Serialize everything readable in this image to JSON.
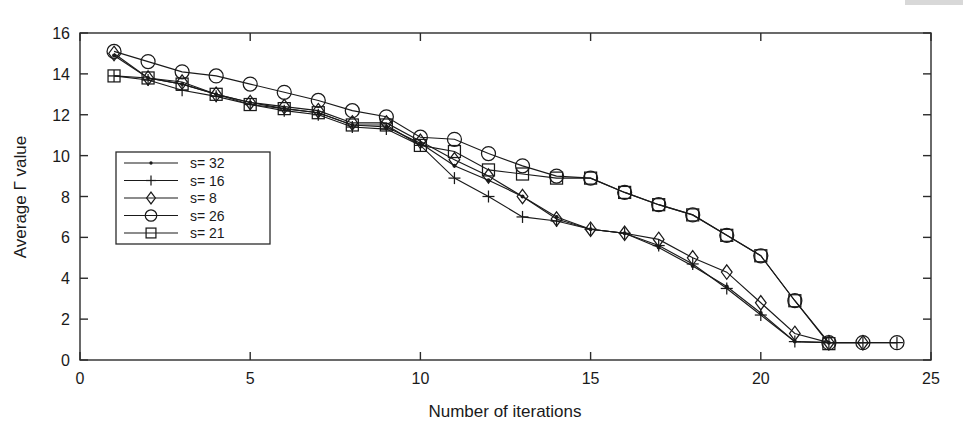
{
  "chart_data": {
    "type": "line",
    "title": "",
    "subtitle": "",
    "xlabel": "Number of iterations",
    "ylabel": "Average Γ value",
    "xlim": [
      0,
      25
    ],
    "ylim": [
      0,
      16
    ],
    "xticks": [
      0,
      5,
      10,
      15,
      20,
      25
    ],
    "yticks": [
      0,
      2,
      4,
      6,
      8,
      10,
      12,
      14,
      16
    ],
    "xtick_labels": [
      "0",
      "5",
      "10",
      "15",
      "20",
      "25"
    ],
    "ytick_labels": [
      "0",
      "2",
      "4",
      "6",
      "8",
      "10",
      "12",
      "14",
      "16"
    ],
    "grid": false,
    "legend_position": "center-left",
    "annotations": [],
    "series": [
      {
        "name": "s= 32",
        "marker": "dot",
        "x": [
          1,
          2,
          3,
          4,
          5,
          6,
          7,
          8,
          9,
          10,
          11,
          12,
          13,
          14,
          15,
          16,
          17,
          18,
          19,
          20,
          21,
          22
        ],
        "values": [
          14.9,
          13.8,
          13.5,
          13.0,
          12.6,
          12.3,
          12.1,
          11.5,
          11.4,
          10.6,
          9.5,
          8.8,
          8.0,
          7.0,
          6.4,
          6.2,
          5.5,
          4.6,
          3.6,
          2.3,
          0.9,
          0.85
        ]
      },
      {
        "name": "s= 16",
        "marker": "plus",
        "x": [
          1,
          2,
          3,
          4,
          5,
          6,
          7,
          8,
          9,
          10,
          11,
          12,
          13,
          14,
          15,
          16,
          17,
          18,
          19,
          20,
          21,
          22,
          23,
          24
        ],
        "values": [
          13.9,
          13.7,
          13.2,
          12.9,
          12.5,
          12.2,
          12.0,
          11.4,
          11.3,
          10.5,
          8.9,
          8.0,
          7.0,
          6.8,
          6.4,
          6.2,
          5.6,
          4.7,
          3.5,
          2.2,
          0.9,
          0.85,
          0.85,
          0.85
        ]
      },
      {
        "name": "s= 8",
        "marker": "diamond",
        "x": [
          1,
          2,
          3,
          4,
          5,
          6,
          7,
          8,
          9,
          10,
          11,
          12,
          13,
          14,
          15,
          16,
          17,
          18,
          19,
          20,
          21,
          22,
          23
        ],
        "values": [
          15.0,
          13.8,
          13.6,
          13.0,
          12.6,
          12.4,
          12.2,
          11.6,
          11.6,
          10.7,
          9.8,
          9.0,
          8.0,
          6.9,
          6.4,
          6.2,
          5.9,
          5.0,
          4.3,
          2.8,
          1.3,
          0.85,
          0.85
        ]
      },
      {
        "name": "s= 26",
        "marker": "circle",
        "x": [
          1,
          2,
          3,
          4,
          5,
          6,
          7,
          8,
          9,
          10,
          11,
          12,
          13,
          14,
          15,
          16,
          17,
          18,
          19,
          20,
          21,
          22,
          23,
          24
        ],
        "values": [
          15.1,
          14.6,
          14.1,
          13.9,
          13.5,
          13.1,
          12.7,
          12.2,
          11.9,
          10.9,
          10.8,
          10.1,
          9.5,
          9.0,
          8.9,
          8.2,
          7.6,
          7.1,
          6.1,
          5.1,
          2.9,
          0.85,
          0.85,
          0.85
        ]
      },
      {
        "name": "s= 21",
        "marker": "square",
        "x": [
          1,
          2,
          3,
          4,
          5,
          6,
          7,
          8,
          9,
          10,
          11,
          12,
          13,
          14,
          15,
          16,
          17,
          18,
          19,
          20,
          21,
          22
        ],
        "values": [
          13.9,
          13.8,
          13.5,
          13.0,
          12.5,
          12.3,
          12.1,
          11.5,
          11.5,
          10.5,
          10.2,
          9.3,
          9.1,
          8.9,
          8.9,
          8.2,
          7.6,
          7.1,
          6.1,
          5.1,
          2.9,
          0.8
        ]
      }
    ]
  },
  "legend": {
    "entries": [
      {
        "label": "s= 32",
        "marker": "dot"
      },
      {
        "label": "s= 16",
        "marker": "plus"
      },
      {
        "label": "s= 8",
        "marker": "diamond"
      },
      {
        "label": "s= 26",
        "marker": "circle"
      },
      {
        "label": "s= 21",
        "marker": "square"
      }
    ]
  },
  "colors": {
    "ink": "#1a1a1a",
    "frame": "#2b2b2b",
    "background": "#ffffff"
  }
}
